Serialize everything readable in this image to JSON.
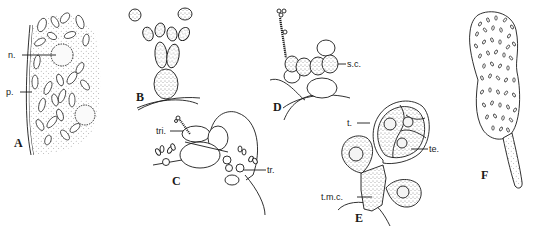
{
  "figure": {
    "panels": [
      {
        "id": "A",
        "label": "A",
        "annotations": [
          {
            "key": "n",
            "text": "n."
          },
          {
            "key": "p",
            "text": "p."
          }
        ]
      },
      {
        "id": "B",
        "label": "B",
        "annotations": []
      },
      {
        "id": "C",
        "label": "C",
        "annotations": [
          {
            "key": "tri",
            "text": "tri."
          },
          {
            "key": "tr",
            "text": "tr."
          }
        ]
      },
      {
        "id": "D",
        "label": "D",
        "annotations": [
          {
            "key": "sc",
            "text": "s.c."
          }
        ]
      },
      {
        "id": "E",
        "label": "E",
        "annotations": [
          {
            "key": "t",
            "text": "t."
          },
          {
            "key": "te",
            "text": "te."
          },
          {
            "key": "tmc",
            "text": "t.m.c."
          }
        ]
      },
      {
        "id": "F",
        "label": "F",
        "annotations": []
      }
    ]
  },
  "colors": {
    "ink": "#1a1a1a",
    "paper": "#ffffff"
  }
}
